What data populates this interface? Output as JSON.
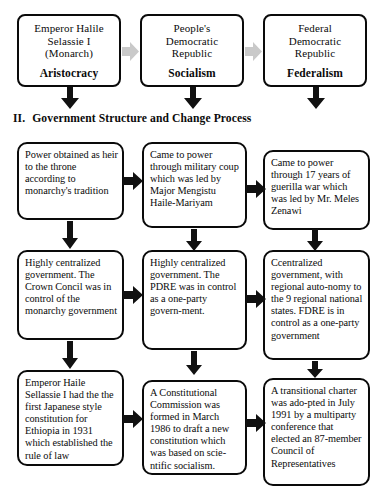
{
  "document": {
    "heading": {
      "numeral": "II.",
      "text": "Government Structure and Change Process"
    }
  },
  "regimes": [
    {
      "name": "regime-monarchy",
      "lines": [
        "Emperor Halile",
        "Selassie I",
        "(Monarch)"
      ],
      "ideology": "Aristocracy"
    },
    {
      "name": "regime-pdre",
      "lines": [
        "People's",
        "Democratic",
        "Republic"
      ],
      "ideology": "Socialism"
    },
    {
      "name": "regime-fdre",
      "lines": [
        "Federal",
        "Democratic",
        "Republic"
      ],
      "ideology": "Federalism"
    }
  ],
  "rows": [
    {
      "row_name": "rise-to-power",
      "cells": [
        "Power obtained as heir to the throne according to monarchy's tradition",
        "Came to power through military coup which was led by Major Mengistu Haile-Mariyam",
        "Came to power through  17 years of guerilla war which was led by Mr. Meles Zenawi"
      ]
    },
    {
      "row_name": "government-structure",
      "cells": [
        "Highly centralized government. The Crown Concil was in control of the monarchy government",
        "Highly centralized government. The PDRE was in control as a one-party govern-ment.",
        "Ccentralized government, with regional auto-nomy to the 9 regional national states. FDRE is in control as a one-party government"
      ]
    },
    {
      "row_name": "constitutional-development",
      "cells": [
        "Emperor Haile Sellassie I had the the first Japanese style  constitution for Ethiopia in 1931 which established the rule of law",
        "A Constitutional Commission was formed in March 1986 to draft a new constitution which was based on scie-ntific socialism.",
        "A transitional charter was ado-pted in July 1991 by a multiparty conference that elected an 87-member Council of Representatives"
      ]
    }
  ],
  "colors": {
    "stroke": "#0a0a0a",
    "arrow_black": "#111111",
    "arrow_gray": "#c9c9c9",
    "background": "#ffffff"
  }
}
